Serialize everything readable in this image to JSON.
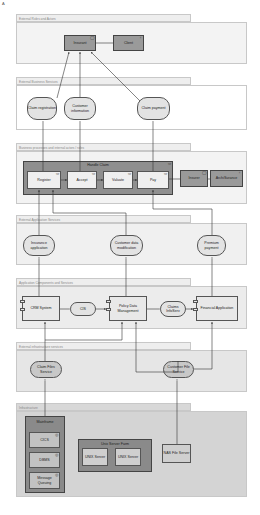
{
  "corner_label": "A",
  "layers": [
    {
      "id": "external-roles",
      "label": "External Roles and Actors"
    },
    {
      "id": "external-business-services",
      "label": "External Business Services"
    },
    {
      "id": "business-processes",
      "label": "Business processes and internal actors / roles"
    },
    {
      "id": "external-application-services",
      "label": "External Application Services"
    },
    {
      "id": "application-components",
      "label": "Application Components and Services"
    },
    {
      "id": "external-infrastructure-services",
      "label": "External infrastructure services"
    },
    {
      "id": "infrastructure",
      "label": "Infrastructure"
    }
  ],
  "roles": {
    "insurant": "Insurant",
    "client": "Client"
  },
  "business_services": {
    "claim_registration": "Claim registration",
    "customer_information": "Customer information",
    "claim_payment": "Claim payment"
  },
  "processes": {
    "handle_claim": "Handle Claim",
    "register": "Register",
    "accept": "Accept",
    "valuate": "Valuate",
    "pay": "Pay",
    "insurer": "Insurer",
    "archisurance": "ArchiSurance"
  },
  "app_services": {
    "insurance_application": "Insurance application",
    "customer_data_modification": "Customer data modification",
    "premium_payment": "Premium payment"
  },
  "app_components": {
    "crm_system": "CRM System",
    "cis": "CIS",
    "policy_data_management": "Policy Data Management",
    "claims_infoserv": "Claims InfoServ",
    "financial_application": "Financial Application"
  },
  "infra_services": {
    "claim_files_service": "Claim Files Service",
    "customer_file_service": "Customer File Service"
  },
  "infrastructure": {
    "mainframe": "Mainframe",
    "cics": "CICS",
    "dbms": "DBMS",
    "message_queuing": "Message Queuing",
    "unix_server_farm": "Unix Server Farm",
    "unix_server_1": "UNIX Server",
    "unix_server_2": "UNIX Server",
    "nas_file_server": "NAS File Server"
  },
  "colors": {
    "actor_fill": "#9a9a9a",
    "service_fill": "#e3e3e3",
    "layer_tab": "#eeeeee",
    "border": "#555555",
    "infra_dark": "#808080"
  }
}
